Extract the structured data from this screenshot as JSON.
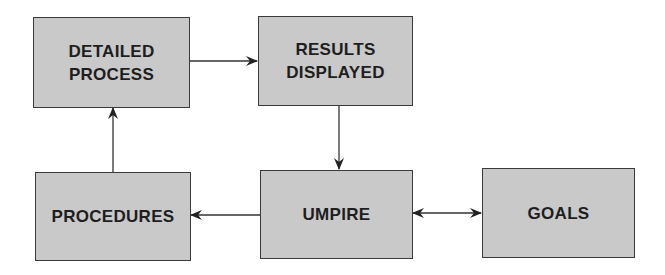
{
  "diagram": {
    "nodes": [
      {
        "id": "detailed_process",
        "label": "DETAILED\nPROCESS"
      },
      {
        "id": "results_displayed",
        "label": "RESULTS\nDISPLAYED"
      },
      {
        "id": "procedures",
        "label": "PROCEDURES"
      },
      {
        "id": "umpire",
        "label": "UMPIRE"
      },
      {
        "id": "goals",
        "label": "GOALS"
      }
    ],
    "edges": [
      {
        "from": "detailed_process",
        "to": "results_displayed",
        "type": "arrow"
      },
      {
        "from": "results_displayed",
        "to": "umpire",
        "type": "arrow"
      },
      {
        "from": "umpire",
        "to": "procedures",
        "type": "arrow"
      },
      {
        "from": "procedures",
        "to": "detailed_process",
        "type": "arrow"
      },
      {
        "from": "umpire",
        "to": "goals",
        "type": "bidirectional"
      }
    ],
    "colors": {
      "box_fill": "#c9c9c9",
      "box_border": "#3a3a3a",
      "text": "#1e1e1e",
      "line": "#333333"
    }
  },
  "labels": {
    "detailed_process_1": "DETAILED",
    "detailed_process_2": "PROCESS",
    "results_displayed_1": "RESULTS",
    "results_displayed_2": "DISPLAYED",
    "procedures": "PROCEDURES",
    "umpire": "UMPIRE",
    "goals": "GOALS"
  }
}
